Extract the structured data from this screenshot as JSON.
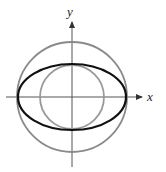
{
  "diagram": {
    "title": "",
    "axes": {
      "x_label": "x",
      "y_label": "y",
      "origin": [
        72,
        97
      ],
      "x_range_px": [
        6,
        142
      ],
      "y_range_px": [
        18,
        167
      ],
      "color": "#555555"
    },
    "shapes": [
      {
        "name": "outer-circle",
        "type": "circle",
        "cx": 72,
        "cy": 97,
        "r": 55,
        "stroke": "#8a8a8a",
        "stroke_width": 1.8
      },
      {
        "name": "inner-circle",
        "type": "circle",
        "cx": 72,
        "cy": 97,
        "r": 32,
        "stroke": "#9a9a9a",
        "stroke_width": 1.8
      },
      {
        "name": "ellipse",
        "type": "ellipse",
        "cx": 72,
        "cy": 97,
        "rx": 54,
        "ry": 33,
        "stroke": "#111111",
        "stroke_width": 2.2
      }
    ]
  }
}
